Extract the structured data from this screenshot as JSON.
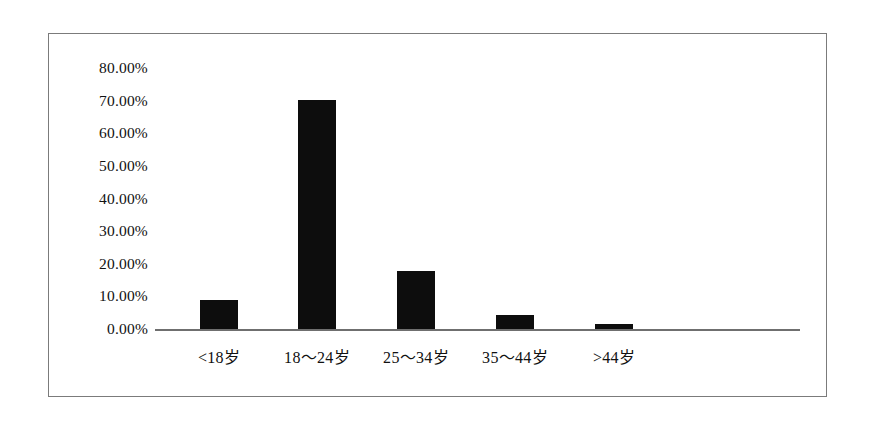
{
  "chart_data": {
    "type": "bar",
    "title": "",
    "subtitle": "",
    "xlabel": "",
    "ylabel": "",
    "categories": [
      "<18岁",
      "18～24岁",
      "25～34岁",
      "35～44岁",
      ">44岁"
    ],
    "values": [
      8.8,
      70.2,
      17.7,
      4.3,
      1.4
    ],
    "value_labels": [
      "8.80%",
      "70.20%",
      "17.70%",
      "4.30%",
      "1.40%"
    ],
    "series": [
      {
        "name": "",
        "values": [
          8.8,
          70.2,
          17.7,
          4.3,
          1.4
        ]
      }
    ],
    "ylim": [
      0,
      80
    ],
    "ytick_values": [
      0,
      10,
      20,
      30,
      40,
      50,
      60,
      70,
      80
    ],
    "ytick_labels": [
      "0.00%",
      "10.00%",
      "20.00%",
      "30.00%",
      "40.00%",
      "50.00%",
      "60.00%",
      "70.00%",
      "80.00%"
    ],
    "grid": false,
    "legend": false,
    "legend_position": "none",
    "bar_color": "#0d0d0d",
    "axis_color": "#6f6f6f",
    "frame_color": "#7b7b7b",
    "background_color": "#ffffff",
    "annotations": []
  },
  "axis": {
    "y_labels": [
      "80.00%",
      "70.00%",
      "60.00%",
      "50.00%",
      "40.00%",
      "30.00%",
      "20.00%",
      "10.00%",
      "0.00%"
    ],
    "x_labels": [
      "<18岁",
      "18～24岁",
      "25～34岁",
      "35～44岁",
      ">44岁"
    ]
  }
}
